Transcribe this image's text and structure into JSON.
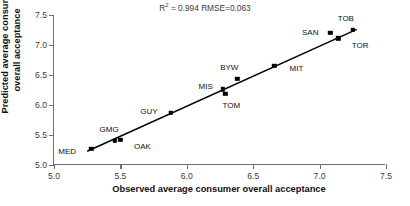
{
  "chart_data": {
    "type": "scatter",
    "title": "",
    "xlabel": "Observed average consumer overall acceptance",
    "ylabel": "Predicted average consumer overall acceptance",
    "ylabel_line1": "Predicted average consumer",
    "ylabel_line2": "overall acceptance",
    "xlim": [
      5.0,
      7.5
    ],
    "ylim": [
      5.0,
      7.5
    ],
    "grid": false,
    "legend": null,
    "xticks": [
      "5.0",
      "5.5",
      "6.0",
      "6.5",
      "7.0",
      "7.5"
    ],
    "yticks": [
      "5.0",
      "5.5",
      "6.0",
      "6.5",
      "7.0",
      "7.5"
    ],
    "xtick_values": [
      5.0,
      5.5,
      6.0,
      6.5,
      7.0,
      7.5
    ],
    "ytick_values": [
      5.0,
      5.5,
      6.0,
      6.5,
      7.0,
      7.5
    ],
    "annotations": {
      "r_squared_prefix": "R",
      "r_squared_exponent": "2",
      "r_squared_text": " = 0.994   RMSE=0.063",
      "r_squared_value": 0.994,
      "rmse_value": 0.063
    },
    "trendline": {
      "type": "linear-fit",
      "x_start": 5.25,
      "y_start": 5.23,
      "x_end": 7.28,
      "y_end": 7.26
    },
    "points": [
      {
        "label": "MED",
        "x": 5.28,
        "y": 5.27,
        "label_dx": -24,
        "label_dy": 2
      },
      {
        "label": "GMG",
        "x": 5.46,
        "y": 5.4,
        "label_dx": -6,
        "label_dy": -12
      },
      {
        "label": "OAK",
        "x": 5.5,
        "y": 5.42,
        "label_dx": 22,
        "label_dy": 6
      },
      {
        "label": "GUY",
        "x": 5.88,
        "y": 5.87,
        "label_dx": -22,
        "label_dy": -2
      },
      {
        "label": "MIS",
        "x": 6.27,
        "y": 6.26,
        "label_dx": -17,
        "label_dy": -3
      },
      {
        "label": "TOM",
        "x": 6.29,
        "y": 6.19,
        "label_dx": 6,
        "label_dy": 11
      },
      {
        "label": "BYW",
        "x": 6.38,
        "y": 6.44,
        "label_dx": -8,
        "label_dy": -12
      },
      {
        "label": "MIT",
        "x": 6.66,
        "y": 6.65,
        "label_dx": 22,
        "label_dy": 2
      },
      {
        "label": "SAN",
        "x": 7.08,
        "y": 7.2,
        "label_dx": -20,
        "label_dy": -1
      },
      {
        "label": "TOB",
        "x": 7.25,
        "y": 7.25,
        "label_dx": -7,
        "label_dy": -12
      },
      {
        "label": "TOR",
        "x": 7.14,
        "y": 7.11,
        "label_dx": 22,
        "label_dy": 7
      }
    ]
  }
}
